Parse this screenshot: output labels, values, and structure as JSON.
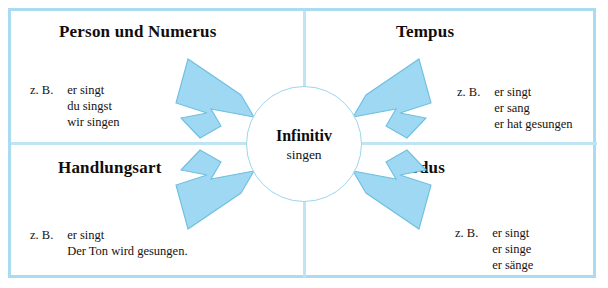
{
  "diagram": {
    "center": {
      "title": "Infinitiv",
      "subtitle": "singen"
    },
    "quadrants": [
      {
        "id": "person",
        "heading": "Person und Numerus",
        "example_label": "z. B.",
        "examples": [
          "er singt",
          "du singst",
          "wir singen"
        ]
      },
      {
        "id": "tempus",
        "heading": "Tempus",
        "example_label": "z. B.",
        "examples": [
          "er singt",
          "er sang",
          "er hat gesungen"
        ]
      },
      {
        "id": "handlungsart",
        "heading": "Handlungsart",
        "example_label": "z. B.",
        "examples": [
          "er singt",
          "Der Ton wird gesungen."
        ]
      },
      {
        "id": "modus",
        "heading": "Modus",
        "example_label": "z. B.",
        "examples": [
          "er singt",
          "er singe",
          "er sänge"
        ]
      }
    ],
    "arrows": [
      {
        "name": "arrow-person-to-center",
        "direction": "down-right"
      },
      {
        "name": "arrow-tempus-to-center",
        "direction": "down-left"
      },
      {
        "name": "arrow-handlungsart-to-center",
        "direction": "up-right"
      },
      {
        "name": "arrow-modus-to-center",
        "direction": "up-left"
      }
    ],
    "colors": {
      "frame": "#a9dcf0",
      "divider": "#bfe4f4",
      "arrow_fill": "#9ed8f2",
      "arrow_stroke": "#6fbfe0",
      "circle_stroke": "#9fd6ee",
      "text": "#100d0c",
      "background": "#ffffff"
    }
  }
}
